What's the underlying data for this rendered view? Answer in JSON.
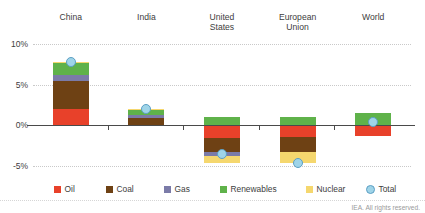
{
  "title_cutoff": "",
  "credit": "IEA. All rights reserved.",
  "axis": {
    "y_ticks": [
      "10%",
      "5%",
      "0%",
      "-5%"
    ],
    "y_values": [
      10,
      5,
      0,
      -5
    ]
  },
  "legend": {
    "items": [
      {
        "label": "Oil",
        "color": "#E8412A",
        "shape": "square"
      },
      {
        "label": "Coal",
        "color": "#6E4114",
        "shape": "square"
      },
      {
        "label": "Gas",
        "color": "#7B7BA8",
        "shape": "square"
      },
      {
        "label": "Renewables",
        "color": "#5FB24A",
        "shape": "square"
      },
      {
        "label": "Nuclear",
        "color": "#F5D76E",
        "shape": "square"
      },
      {
        "label": "Total",
        "color": "#9FD4E8",
        "shape": "circle"
      }
    ]
  },
  "chart_data": {
    "type": "bar",
    "subtype": "stacked-waterfall",
    "title": "",
    "xlabel": "",
    "ylabel": "",
    "ylim": [
      -6.5,
      11
    ],
    "grid": true,
    "legend_position": "bottom",
    "unit": "percent",
    "categories": [
      "China",
      "India",
      "United States",
      "European Union",
      "World"
    ],
    "series": [
      {
        "name": "Oil",
        "color": "#E8412A",
        "values": [
          1.95,
          0.0,
          -1.55,
          -1.4,
          -1.35
        ]
      },
      {
        "name": "Coal",
        "color": "#6E4114",
        "values": [
          3.55,
          0.95,
          -1.7,
          -1.95,
          0.0
        ]
      },
      {
        "name": "Gas",
        "color": "#7B7BA8",
        "values": [
          0.7,
          0.35,
          -0.55,
          0.0,
          0.0
        ]
      },
      {
        "name": "Renewables",
        "color": "#5FB24A",
        "values": [
          1.45,
          0.55,
          1.05,
          1.05,
          1.5
        ]
      },
      {
        "name": "Nuclear",
        "color": "#F5D76E",
        "values": [
          0.2,
          0.1,
          -0.85,
          -1.25,
          0.0
        ]
      }
    ],
    "total": {
      "name": "Total",
      "color": "#9FD4E8",
      "values": [
        7.85,
        1.95,
        -3.6,
        -4.6,
        0.4
      ]
    }
  }
}
